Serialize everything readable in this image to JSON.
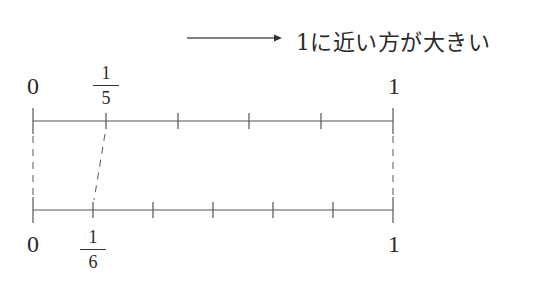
{
  "caption": {
    "arrow": "right-arrow",
    "text": "1に近い方が大きい"
  },
  "top_line": {
    "divisions": 5,
    "start_label": "0",
    "end_label": "1",
    "marked_fraction": {
      "numerator": "1",
      "denominator": "5"
    }
  },
  "bottom_line": {
    "divisions": 6,
    "start_label": "0",
    "end_label": "1",
    "marked_fraction": {
      "numerator": "1",
      "denominator": "6"
    }
  },
  "colors": {
    "line": "#555555",
    "text": "#2a2a2a",
    "background": "#ffffff"
  }
}
